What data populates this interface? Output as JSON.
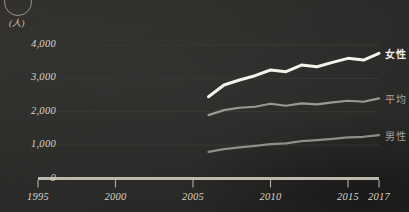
{
  "figure": {
    "unit_label": "(人)",
    "corner_mark": "circle-outline"
  },
  "chart_data": {
    "type": "line",
    "title": "",
    "subtitle": "",
    "xlabel": "",
    "ylabel": "(人)",
    "xlim": [
      1995,
      2017
    ],
    "ylim": [
      0,
      4000
    ],
    "grid": true,
    "legend_position": "right-of-line-ends",
    "x_ticks": [
      "1995",
      "2000",
      "2005",
      "2010",
      "2015",
      "2017"
    ],
    "x_tick_values": [
      1995,
      2000,
      2005,
      2010,
      2015,
      2017
    ],
    "y_ticks": [
      "0",
      "1,000",
      "2,000",
      "3,000",
      "4,000"
    ],
    "y_tick_values": [
      0,
      1000,
      2000,
      3000,
      4000
    ],
    "x": [
      2006,
      2007,
      2008,
      2009,
      2010,
      2011,
      2012,
      2013,
      2014,
      2015,
      2016,
      2017
    ],
    "series": [
      {
        "name": "女性",
        "color": "#f5f2ea",
        "values": [
          2450,
          2800,
          2950,
          3080,
          3250,
          3200,
          3400,
          3350,
          3480,
          3600,
          3550,
          3750
        ]
      },
      {
        "name": "平均",
        "color": "#9b9992",
        "values": [
          1900,
          2050,
          2120,
          2150,
          2240,
          2180,
          2250,
          2220,
          2280,
          2330,
          2300,
          2400
        ]
      },
      {
        "name": "男性",
        "color": "#908e87",
        "values": [
          800,
          880,
          930,
          980,
          1030,
          1050,
          1120,
          1150,
          1190,
          1230,
          1250,
          1300
        ]
      }
    ]
  }
}
